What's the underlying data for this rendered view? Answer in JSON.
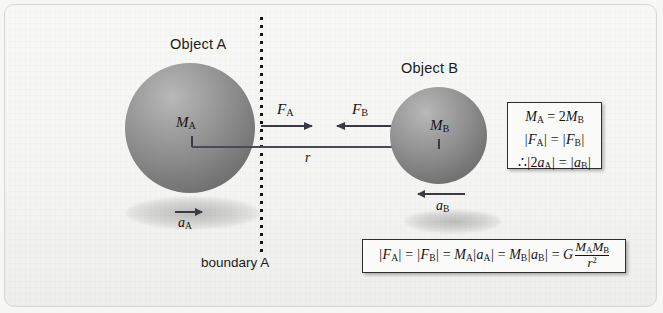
{
  "figure": {
    "background_color": "#f4f4f2",
    "frame_color": "#d8d8d6"
  },
  "objects": [
    {
      "id": "A",
      "label": "Object A",
      "mass_label": "M",
      "mass_subscript": "A",
      "sphere_color": "#8b8b8b"
    },
    {
      "id": "B",
      "label": "Object B",
      "mass_label": "M",
      "mass_subscript": "B",
      "sphere_color": "#8b8b8b"
    }
  ],
  "labels": {
    "object_a": "Object A",
    "object_b": "Object B",
    "boundary": "boundary A",
    "mass_a": "M",
    "mass_a_sub": "A",
    "mass_b": "M",
    "mass_b_sub": "B",
    "force_a": "F",
    "force_a_sub": "A",
    "force_b": "F",
    "force_b_sub": "B",
    "accel_a": "a",
    "accel_a_sub": "A",
    "accel_b": "a",
    "accel_b_sub": "B",
    "separation": "r"
  },
  "arrows": [
    {
      "name": "force-a",
      "symbol": "F_A",
      "direction": "right",
      "meaning": "gravitational force on A toward B"
    },
    {
      "name": "force-b",
      "symbol": "F_B",
      "direction": "left",
      "meaning": "gravitational force on B toward A"
    },
    {
      "name": "accel-a",
      "symbol": "a_A",
      "direction": "right",
      "meaning": "acceleration of A"
    },
    {
      "name": "accel-b",
      "symbol": "a_B",
      "direction": "left",
      "meaning": "acceleration of B"
    },
    {
      "name": "separation-r",
      "symbol": "r",
      "direction": "none",
      "meaning": "center-to-center distance"
    }
  ],
  "ratio_box": {
    "lines": [
      {
        "id": "mass-relation",
        "text": "M_A = 2 M_B",
        "parts": [
          {
            "t": "M",
            "sub": "A"
          },
          {
            "t": " = 2"
          },
          {
            "t": "M",
            "sub": "B"
          }
        ]
      },
      {
        "id": "force-equality",
        "text": "|F_A| = |F_B|",
        "parts": [
          {
            "t": "|"
          },
          {
            "t": "F",
            "sub": "A"
          },
          {
            "t": "|"
          },
          {
            "t": " = "
          },
          {
            "t": "|"
          },
          {
            "t": "F",
            "sub": "B"
          },
          {
            "t": "|"
          }
        ]
      },
      {
        "id": "accel-relation",
        "text": "∴ |2a_A| = |a_B|",
        "parts": [
          {
            "t": "∴ "
          },
          {
            "t": "|2"
          },
          {
            "t": "a",
            "sub": "A"
          },
          {
            "t": "|"
          },
          {
            "t": " = "
          },
          {
            "t": "|"
          },
          {
            "t": "a",
            "sub": "B"
          },
          {
            "t": "|"
          }
        ]
      }
    ]
  },
  "law_box": {
    "id": "newton-gravitation",
    "text": "|F_A| = |F_B| = M_A|a_A| = M_B|a_B| = G (M_A M_B) / r^2",
    "gravitational_constant": "G",
    "numerator": "M_A M_B",
    "denominator": "r^2"
  }
}
